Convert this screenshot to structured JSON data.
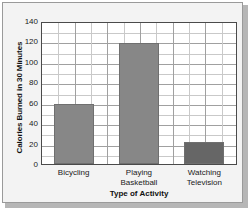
{
  "chart_data": {
    "type": "bar",
    "title": "",
    "categories": [
      "Bicycling",
      "Playing Basketball",
      "Watching Television"
    ],
    "category_lines": [
      [
        "Bicycling"
      ],
      [
        "Playing",
        "Basketball"
      ],
      [
        "Watching",
        "Television"
      ]
    ],
    "values": [
      60,
      120,
      22
    ],
    "xlabel": "Type of Activity",
    "ylabel": "Calories Burned in 30 Minutes",
    "ylim": [
      0,
      140
    ],
    "ytick_labels": [
      "0",
      "20",
      "40",
      "60",
      "80",
      "100",
      "120",
      "140"
    ],
    "ytick_values": [
      0,
      20,
      40,
      60,
      80,
      100,
      120,
      140
    ],
    "y_minor_step": 10,
    "grid": true,
    "legend": "none",
    "bar_colors": [
      "#878787",
      "#878787",
      "#666666"
    ],
    "plot_background": "#ffffff",
    "figure_background": "#f3f3f3"
  }
}
